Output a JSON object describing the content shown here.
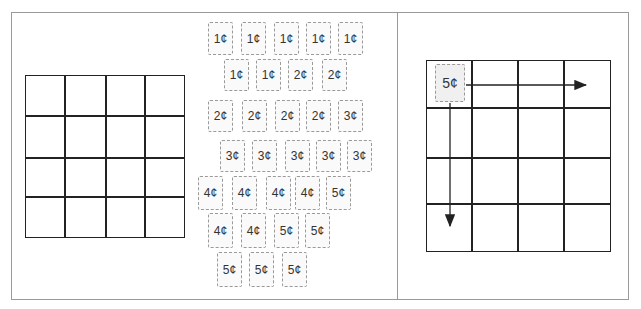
{
  "left_panel": {
    "grid": {
      "rows": 4,
      "cols": 4
    }
  },
  "stamp_pile": {
    "rows": [
      [
        "1¢",
        "1¢",
        "1¢",
        "1¢",
        "1¢"
      ],
      [
        "1¢",
        "1¢",
        "2¢",
        "2¢"
      ],
      [
        "2¢",
        "2¢",
        "2¢",
        "2¢",
        "3¢"
      ],
      [
        "3¢",
        "3¢",
        "3¢",
        "3¢",
        "3¢"
      ],
      [
        "4¢",
        "4¢",
        "4¢",
        "4¢",
        "5¢"
      ],
      [
        "4¢",
        "4¢",
        "5¢",
        "5¢"
      ],
      [
        "5¢",
        "5¢",
        "5¢"
      ]
    ]
  },
  "right_panel": {
    "grid": {
      "rows": 4,
      "cols": 4
    },
    "placed_stamp": "5¢",
    "arrows": [
      "right",
      "down"
    ]
  }
}
